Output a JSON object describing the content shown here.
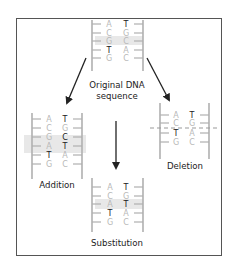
{
  "diagram": {
    "colors": {
      "border": "#555555",
      "backbone": "#b0b0b0",
      "highlight": "#e6e6e6",
      "dark_base": "#222222",
      "light_base": "#b8b8b8",
      "arrow": "#222222"
    },
    "original": {
      "label_line1": "Original DNA",
      "label_line2": "sequence",
      "pairs": [
        {
          "left": "A",
          "right": "T",
          "left_dark": false,
          "right_dark": true
        },
        {
          "left": "C",
          "right": "G",
          "left_dark": false,
          "right_dark": false
        },
        {
          "left": "G",
          "right": "C",
          "left_dark": false,
          "right_dark": false,
          "highlight": true
        },
        {
          "left": "T",
          "right": "A",
          "left_dark": true,
          "right_dark": false
        },
        {
          "left": "G",
          "right": "C",
          "left_dark": false,
          "right_dark": false
        }
      ]
    },
    "addition": {
      "label": "Addition",
      "pairs": [
        {
          "left": "A",
          "right": "T"
        },
        {
          "left": "C",
          "right": "G"
        },
        {
          "left": "G",
          "right": "C",
          "highlight": true
        },
        {
          "left": "A",
          "right": "T",
          "highlight": true,
          "added": true
        },
        {
          "left": "T",
          "right": "A"
        },
        {
          "left": "G",
          "right": "C"
        }
      ]
    },
    "deletion": {
      "label": "Deletion",
      "pairs": [
        {
          "left": "A",
          "right": "T"
        },
        {
          "left": "C",
          "right": "G"
        },
        {
          "left": "T",
          "right": "A"
        },
        {
          "left": "G",
          "right": "C"
        }
      ],
      "deleted_pair_marker": "dashed line between C–G and T–A"
    },
    "substitution": {
      "label": "Substitution",
      "pairs": [
        {
          "left": "A",
          "right": "T"
        },
        {
          "left": "C",
          "right": "G"
        },
        {
          "left": "A",
          "right": "T",
          "highlight": true,
          "substituted": true
        },
        {
          "left": "T",
          "right": "A"
        },
        {
          "left": "G",
          "right": "C"
        }
      ]
    }
  }
}
